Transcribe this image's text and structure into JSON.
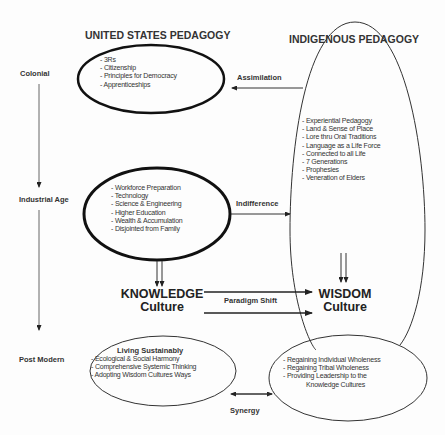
{
  "headers": {
    "us": "UNITED STATES PEDAGOGY",
    "indigenous": "INDIGENOUS PEDAGOGY"
  },
  "eras": [
    "Colonial",
    "Industrial Age",
    "Post Modern"
  ],
  "us_colonial": {
    "items": [
      "- 3Rs",
      "- Citizenship",
      "- Principles for Democracy",
      "- Apprenticeships"
    ]
  },
  "us_industrial": {
    "items": [
      "- Workforce Preparation",
      "- Technology",
      "- Science & Engineering",
      "- Higher Education",
      "- Wealth & Accumulation",
      "- Disjointed from Family"
    ]
  },
  "indigenous": {
    "items": [
      "- Experiential Pedagogy",
      "- Land & Sense of Place",
      "- Lore thru Oral Traditions",
      "- Language as a Life Force",
      "- Connected to all Life",
      "- 7 Generations",
      "- Prophesies",
      "- Veneration of Elders"
    ]
  },
  "relations": {
    "assimilation": "Assimilation",
    "indifference": "Indifference",
    "paradigm_shift": "Paradigm Shift",
    "synergy": "Synergy"
  },
  "knowledge": {
    "line1": "KNOWLEDGE",
    "line2": "Culture"
  },
  "wisdom": {
    "line1": "WISDOM",
    "line2": "Culture"
  },
  "post_modern_us": {
    "title": "Living Sustainably",
    "items": [
      "- Ecological & Social Harmony",
      "- Comprehensive Systemic Thinking",
      "- Adopting Wisdom Cultures Ways"
    ]
  },
  "post_modern_indigenous": {
    "items": [
      "- Regaining Individual Wholeness",
      "- Regaining Tribal Wholeness",
      "- Providing Leadership to the",
      "Knowledge Cultures"
    ]
  }
}
